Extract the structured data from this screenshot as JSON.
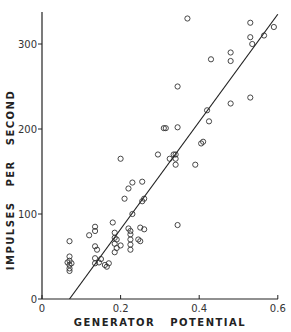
{
  "chart_data": {
    "type": "scatter",
    "title": "",
    "xlabel": "GENERATOR   POTENTIAL",
    "ylabel": "IMPULSES   PER   SECOND",
    "xlim": [
      0,
      0.6
    ],
    "ylim": [
      0,
      340
    ],
    "grid": false,
    "legend": null,
    "x_ticks": [
      0,
      0.2,
      0.4,
      0.6
    ],
    "x_tick_labels": [
      "0",
      "0.2",
      "0.4",
      "0.6"
    ],
    "y_ticks": [
      0,
      100,
      200,
      300
    ],
    "y_tick_labels": [
      "0",
      "100",
      "200",
      "300"
    ],
    "marker": "open-circle",
    "series": [
      {
        "name": "observations",
        "points": [
          [
            0.07,
            68
          ],
          [
            0.07,
            50
          ],
          [
            0.07,
            45
          ],
          [
            0.065,
            43
          ],
          [
            0.07,
            40
          ],
          [
            0.075,
            42
          ],
          [
            0.07,
            36
          ],
          [
            0.07,
            33
          ],
          [
            0.12,
            75
          ],
          [
            0.135,
            85
          ],
          [
            0.135,
            80
          ],
          [
            0.135,
            62
          ],
          [
            0.14,
            58
          ],
          [
            0.135,
            48
          ],
          [
            0.15,
            47
          ],
          [
            0.145,
            43
          ],
          [
            0.135,
            42
          ],
          [
            0.16,
            40
          ],
          [
            0.165,
            38
          ],
          [
            0.17,
            42
          ],
          [
            0.18,
            90
          ],
          [
            0.185,
            78
          ],
          [
            0.185,
            72
          ],
          [
            0.19,
            70
          ],
          [
            0.185,
            65
          ],
          [
            0.2,
            63
          ],
          [
            0.19,
            60
          ],
          [
            0.185,
            55
          ],
          [
            0.21,
            118
          ],
          [
            0.22,
            130
          ],
          [
            0.23,
            137
          ],
          [
            0.22,
            83
          ],
          [
            0.225,
            80
          ],
          [
            0.225,
            76
          ],
          [
            0.225,
            70
          ],
          [
            0.225,
            64
          ],
          [
            0.225,
            58
          ],
          [
            0.23,
            100
          ],
          [
            0.245,
            70
          ],
          [
            0.25,
            68
          ],
          [
            0.25,
            84
          ],
          [
            0.255,
            138
          ],
          [
            0.26,
            118
          ],
          [
            0.255,
            115
          ],
          [
            0.26,
            82
          ],
          [
            0.2,
            165
          ],
          [
            0.295,
            170
          ],
          [
            0.31,
            201
          ],
          [
            0.315,
            201
          ],
          [
            0.325,
            165
          ],
          [
            0.335,
            170
          ],
          [
            0.34,
            165
          ],
          [
            0.34,
            170
          ],
          [
            0.345,
            202
          ],
          [
            0.345,
            250
          ],
          [
            0.34,
            158
          ],
          [
            0.39,
            158
          ],
          [
            0.345,
            87
          ],
          [
            0.37,
            330
          ],
          [
            0.405,
            183
          ],
          [
            0.41,
            185
          ],
          [
            0.42,
            222
          ],
          [
            0.425,
            209
          ],
          [
            0.43,
            282
          ],
          [
            0.48,
            230
          ],
          [
            0.48,
            290
          ],
          [
            0.48,
            280
          ],
          [
            0.53,
            325
          ],
          [
            0.53,
            308
          ],
          [
            0.535,
            300
          ],
          [
            0.53,
            237
          ],
          [
            0.565,
            310
          ],
          [
            0.59,
            320
          ]
        ]
      }
    ],
    "regression_line": {
      "x": [
        0.07,
        0.6
      ],
      "y": [
        0,
        335
      ]
    }
  }
}
